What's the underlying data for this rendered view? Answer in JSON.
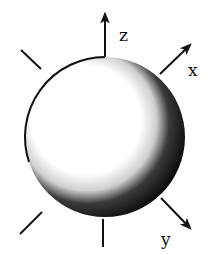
{
  "diagram": {
    "sphere": {
      "center": [
        105,
        137
      ],
      "radius": 80,
      "light_color": "#ffffff",
      "shadow_color": "#111111"
    },
    "axes": [
      {
        "name": "z",
        "label": "z",
        "from": [
          105,
          57
        ],
        "to": [
          105,
          13
        ],
        "label_pos": [
          119,
          41
        ]
      },
      {
        "name": "x",
        "label": "x",
        "from": [
          160,
          74
        ],
        "to": [
          191,
          44
        ],
        "label_pos": [
          190,
          76
        ]
      },
      {
        "name": "y",
        "label": "y",
        "from": [
          161,
          198
        ],
        "to": [
          191,
          229
        ],
        "label_pos": [
          162,
          245
        ]
      }
    ],
    "ticks": [
      {
        "name": "upper-left",
        "from": [
          21,
          50
        ],
        "to": [
          41,
          69
        ]
      },
      {
        "name": "lower-left",
        "from": [
          20,
          234
        ],
        "to": [
          42,
          212
        ]
      },
      {
        "name": "bottom",
        "from": [
          103,
          219
        ],
        "to": [
          103,
          247
        ]
      }
    ]
  }
}
